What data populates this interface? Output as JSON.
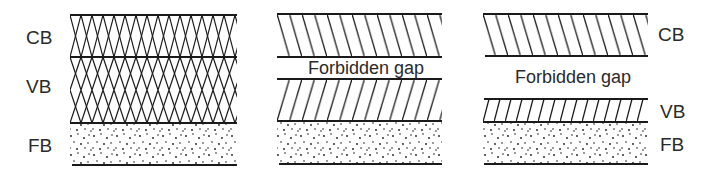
{
  "diagram": {
    "colors": {
      "line": "#1a1a1a",
      "text": "#2a2a2a",
      "background": "#ffffff"
    },
    "panels": [
      {
        "id": "overlapping",
        "labels": {
          "cb": "CB",
          "vb": "VB",
          "fb": "FB"
        },
        "bands": [
          {
            "name": "CB",
            "pattern": "cross-hatch"
          },
          {
            "name": "VB",
            "pattern": "cross-hatch"
          },
          {
            "name": "FB",
            "pattern": "dots"
          }
        ]
      },
      {
        "id": "small-gap",
        "gap_label": "Forbidden gap",
        "bands": [
          {
            "name": "CB",
            "pattern": "hatch-back"
          },
          {
            "name": "VB",
            "pattern": "hatch-forward"
          },
          {
            "name": "FB",
            "pattern": "dots"
          }
        ]
      },
      {
        "id": "large-gap",
        "gap_label": "Forbidden gap",
        "labels": {
          "cb": "CB",
          "vb": "VB",
          "fb": "FB"
        },
        "bands": [
          {
            "name": "CB",
            "pattern": "hatch-back"
          },
          {
            "name": "VB",
            "pattern": "hatch-forward"
          },
          {
            "name": "FB",
            "pattern": "dots"
          }
        ]
      }
    ]
  }
}
